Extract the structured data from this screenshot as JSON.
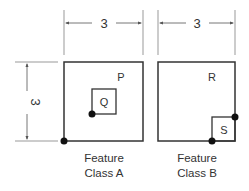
{
  "dimensions": {
    "top_a": "3",
    "top_b": "3",
    "side": "3"
  },
  "feature_a": {
    "outer_label": "P",
    "inner_label": "Q",
    "caption_line1": "Feature",
    "caption_line2": "Class A"
  },
  "feature_b": {
    "outer_label": "R",
    "inner_label": "S",
    "caption_line1": "Feature",
    "caption_line2": "Class B"
  },
  "colors": {
    "line": "#333333",
    "dim_line": "#888888",
    "dot": "#111111"
  }
}
